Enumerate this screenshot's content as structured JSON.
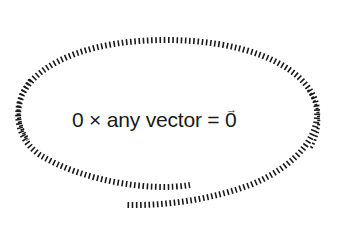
{
  "diagram": {
    "formula": {
      "prefix": "0 × any vector = ",
      "vector_symbol": "0",
      "vector_arrow": "→"
    },
    "outline": {
      "shape": "hatched-spiral-ellipse",
      "stroke_color": "#1a1a1a",
      "background": "#ffffff"
    }
  }
}
